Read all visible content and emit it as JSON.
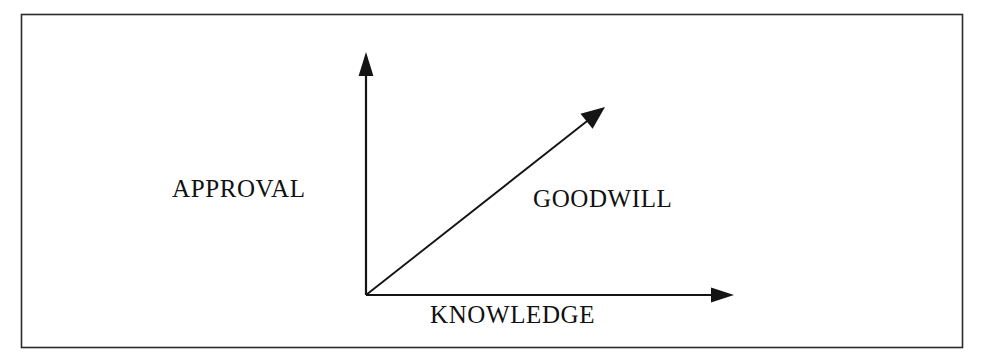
{
  "diagram": {
    "background_color": "#ffffff",
    "border_color": "#2b2b2b",
    "stroke_color": "#141414",
    "border": {
      "x": 21,
      "y": 14,
      "width": 942,
      "height": 334
    },
    "origin": {
      "x": 366,
      "y": 295
    },
    "axes": [
      {
        "name": "vertical-axis",
        "label": "APPROVAL",
        "from": {
          "x": 366,
          "y": 295
        },
        "to": {
          "x": 366,
          "y": 54
        },
        "arrowhead": true
      },
      {
        "name": "horizontal-axis",
        "label": "KNOWLEDGE",
        "from": {
          "x": 366,
          "y": 295
        },
        "to": {
          "x": 733,
          "y": 295
        },
        "arrowhead": true
      },
      {
        "name": "diagonal-axis",
        "label": "GOODWILL",
        "from": {
          "x": 366,
          "y": 295
        },
        "to": {
          "x": 604,
          "y": 108
        },
        "arrowhead": true
      }
    ],
    "labels": {
      "vertical": "APPROVAL",
      "diagonal": "GOODWILL",
      "horizontal": "KNOWLEDGE"
    }
  }
}
